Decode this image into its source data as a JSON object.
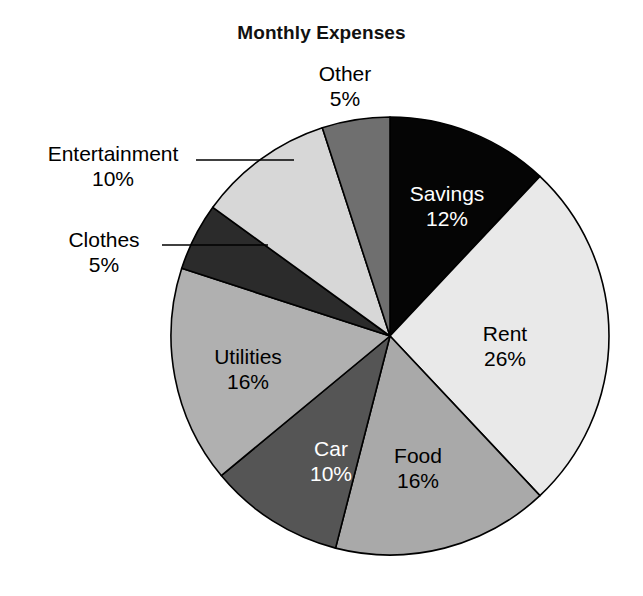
{
  "chart_data": {
    "type": "pie",
    "title": "Monthly Expenses",
    "xlabel": "",
    "ylabel": "",
    "legend_position": "none",
    "grid": false,
    "start_angle_deg": 0,
    "direction": "clockwise",
    "total_percent": 100,
    "categories": [
      "Savings",
      "Rent",
      "Food",
      "Car",
      "Utilities",
      "Clothes",
      "Entertainment",
      "Other"
    ],
    "values": [
      12,
      26,
      16,
      10,
      16,
      5,
      10,
      5
    ],
    "value_labels": [
      "12%",
      "26%",
      "16%",
      "10%",
      "16%",
      "5%",
      "10%",
      "5%"
    ],
    "slices": [
      {
        "name": "Savings",
        "value": 12,
        "value_label": "12%",
        "color": "#050505",
        "label_color": "#ffffff",
        "label_placement": "inside",
        "label_x": 447,
        "label_y": 182
      },
      {
        "name": "Rent",
        "value": 26,
        "value_label": "26%",
        "color": "#e9e9e9",
        "label_color": "#000000",
        "label_placement": "inside",
        "label_x": 505,
        "label_y": 322
      },
      {
        "name": "Food",
        "value": 16,
        "value_label": "16%",
        "color": "#a9a9a9",
        "label_color": "#000000",
        "label_placement": "inside",
        "label_x": 418,
        "label_y": 444
      },
      {
        "name": "Car",
        "value": 10,
        "value_label": "10%",
        "color": "#555555",
        "label_color": "#ffffff",
        "label_placement": "inside",
        "label_x": 331,
        "label_y": 437
      },
      {
        "name": "Utilities",
        "value": 16,
        "value_label": "16%",
        "color": "#b0b0b0",
        "label_color": "#000000",
        "label_placement": "inside",
        "label_x": 248,
        "label_y": 345
      },
      {
        "name": "Clothes",
        "value": 5,
        "value_label": "5%",
        "color": "#2b2b2b",
        "label_color": "#000000",
        "label_placement": "outside-leader",
        "label_x": 104,
        "label_y": 228
      },
      {
        "name": "Entertainment",
        "value": 10,
        "value_label": "10%",
        "color": "#d7d7d7",
        "label_color": "#000000",
        "label_placement": "outside-leader",
        "label_x": 113,
        "label_y": 142
      },
      {
        "name": "Other",
        "value": 5,
        "value_label": "5%",
        "color": "#6f6f6f",
        "label_color": "#000000",
        "label_placement": "outside",
        "label_x": 345,
        "label_y": 62
      }
    ],
    "geometry": {
      "center_x": 390,
      "center_y": 336,
      "radius": 219
    },
    "leader_lines": [
      {
        "for": "Entertainment",
        "x1": 196,
        "y1": 160,
        "x2": 294,
        "y2": 160
      },
      {
        "for": "Clothes",
        "x1": 162,
        "y1": 245,
        "x2": 268,
        "y2": 245
      }
    ]
  },
  "colors": {
    "background": "#ffffff",
    "outline": "#000000",
    "title": "#111111"
  }
}
